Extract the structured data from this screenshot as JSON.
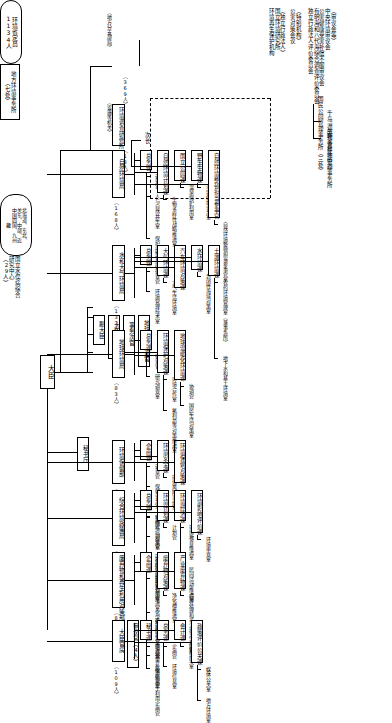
{
  "chart": {
    "root": {
      "label": "大臣"
    },
    "headcount_note": {
      "label": "环境省定员",
      "value": "1134人"
    },
    "ministerial_posts": [
      {
        "label": "副大臣"
      },
      {
        "label": "大臣政务官"
      },
      {
        "label": "事务次官"
      },
      {
        "label": "地球环境审议官"
      }
    ],
    "secretariat": {
      "label": "秘书厅"
    },
    "facilities_heading": {
      "label": "（设施等机关）"
    },
    "local_branch_heading": {
      "label": "（地方分支部局）"
    },
    "local_env_office": {
      "label": "地方环境事务所\n（七处）",
      "count": "（369人）"
    },
    "regions_bubble": {
      "label": "北海道、东北、关东、中部、近畿、中国四国、九州"
    },
    "env_survey_lab": {
      "label": "环境调查研修所",
      "count": "（18人）"
    },
    "vice_minister_link": {
      "label": "次长"
    },
    "national_water_research": {
      "label": "国立水俣病综合研究中心",
      "count": "（29人）"
    },
    "independent_admin_heading": {
      "label": "（独立行政法人）"
    },
    "independent_admin_items": [
      {
        "label": "国立环境研究所"
      },
      {
        "label": "环境再生保护机构"
      }
    ],
    "special_org_heading": {
      "label": "（特别机构）"
    },
    "special_org_items": [
      {
        "label": "公害对策会议"
      }
    ],
    "councils_heading": {
      "label": "（审议会等）"
    },
    "councils_items": [
      {
        "label": "中央环境审议会"
      },
      {
        "label": "公害健康受害补偿不服审议会"
      },
      {
        "label": "有明海和八代海综合调查评价委员会"
      },
      {
        "label": "独立行政法人评价委员会"
      }
    ],
    "national_park_offices": {
      "label": "国民公园管理事务所（三处）"
    },
    "national_park_children": [
      {
        "label": "千岛洲战死者墓地管理事务所"
      },
      {
        "label": "生物多样性中心"
      }
    ],
    "bureaus": [
      {
        "name": "自然环境局",
        "count": "（168人）",
        "divisions": [
          {
            "name": "总务课",
            "items": [
              {
                "label": "调查官"
              },
              {
                "label": "人与自然共生室"
              },
              {
                "label": "保护动物管理室"
              }
            ]
          },
          {
            "name": "自然环境计划课",
            "items": [
              {
                "label": "生物多样性战略推进室"
              }
            ]
          },
          {
            "name": "国立公园课",
            "items": [
              {
                "label": "温泉保护利用室"
              }
            ]
          },
          {
            "name": "野生生物课",
            "items": [
              {
                "label": "鸟兽保护业务室"
              }
            ]
          },
          {
            "name": "自然环境整顿担当参事官",
            "items": [
              {
                "label": "自然环境整顿担当参事官室"
              }
            ]
          }
        ]
      },
      {
        "name": "水和大气环境局",
        "count": "（137人）",
        "divisions": [
          {
            "name": "总务课",
            "items": [
              {
                "label": "调查官"
              },
              {
                "label": "环境管理技术室"
              }
            ]
          },
          {
            "name": "大气环境课",
            "items": [
              {
                "label": "大气生活环境室"
              }
            ]
          },
          {
            "name": "汽车环境对策课",
            "items": []
          },
          {
            "name": "水环境课",
            "items": [
              {
                "label": "封闭性海域对策室"
              }
            ]
          },
          {
            "name": "土壤环境课",
            "items": [
              {
                "label": "农药环境管理室（兼事务所）"
              },
              {
                "label": "地下水和基土环境室"
              }
            ]
          }
        ]
      },
      {
        "name": "环境保健部",
        "count": "（60人）",
        "divisions": [
          {
            "name": "企画课",
            "items": [
              {
                "label": "调查官"
              },
              {
                "label": "保健业务室"
              },
              {
                "label": "特殊疾病对策室"
              },
              {
                "label": "石棉健康危害对策室"
              },
              {
                "label": "化学物质审查室"
              },
              {
                "label": "公害补偿审查室"
              }
            ]
          },
          {
            "name": "环境安全课",
            "items": [
              {
                "label": "环境风险评价室"
              }
            ]
          },
          {
            "name": "环境保健对策课",
            "items": []
          }
        ]
      },
      {
        "name": "地球环境局",
        "count": "（83人）",
        "divisions": [
          {
            "name": "总务课",
            "items": [
              {
                "label": "调查官"
              },
              {
                "label": "研究调查室"
              }
            ]
          },
          {
            "name": "环境保护对策课",
            "items": [
              {
                "label": "环境合作室"
              },
              {
                "label": "氟利昂等对策推进室"
              }
            ]
          },
          {
            "name": "地球温暖化环境课",
            "items": [
              {
                "label": "协调官"
              },
              {
                "label": "国民生活对策室"
              }
            ]
          }
        ]
      },
      {
        "name": "综合环境政策局",
        "count": "（76人）",
        "divisions": [
          {
            "name": "总务课",
            "items": [
              {
                "label": "企画官"
              },
              {
                "label": "调查官"
              },
              {
                "label": "环境研究技术室"
              }
            ]
          },
          {
            "name": "环境计划课",
            "items": [
              {
                "label": "计划官"
              }
            ]
          },
          {
            "name": "环境经济课",
            "items": [
              {
                "label": "环境教育推进室"
              },
              {
                "label": "民间活动推进室"
              }
            ]
          },
          {
            "name": "环境影响评价课",
            "items": [
              {
                "label": "环境审查室"
              }
            ]
          }
        ]
      },
      {
        "name": "废弃物和再生利用对策部",
        "count": "（85人）",
        "divisions": [
          {
            "name": "企画课",
            "items": [
              {
                "label": "再生利用推进室"
              },
              {
                "label": "循环型社会推进室"
              },
              {
                "label": "废弃物再生利用企画官"
              }
            ]
          },
          {
            "name": "废弃物对策课",
            "items": [
              {
                "label": "净化槽推进室"
              }
            ]
          },
          {
            "name": "产业废弃物课",
            "items": [
              {
                "label": "合理处理和非法投弃对策室"
              }
            ]
          }
        ]
      },
      {
        "name": "大臣官房",
        "count": "（109人）",
        "extra": "审议官（4人）",
        "divisions": [
          {
            "name": "秘书课",
            "items": [
              {
                "label": "调查官"
              }
            ]
          },
          {
            "name": "总务课",
            "items": [
              {
                "label": "企画官"
              },
              {
                "label": "环境信息室"
              }
            ]
          },
          {
            "name": "会计课",
            "items": [
              {
                "label": "监察指导室"
              }
            ]
          },
          {
            "name": "政策评价公关课",
            "items": [
              {
                "label": "媒体公关室"
              },
              {
                "label": "地方环境室"
              }
            ]
          }
        ]
      }
    ]
  }
}
